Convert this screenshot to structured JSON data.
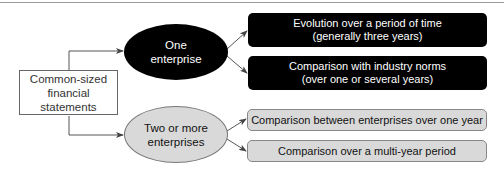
{
  "diagram": {
    "source": {
      "label": "Common-sized\nfinancial\nstatements"
    },
    "branches": [
      {
        "label": "One\nenterprise",
        "style": "black",
        "fill": "#000000",
        "children": [
          {
            "label": "Evolution over a period of time\n(generally three years)"
          },
          {
            "label": "Comparison with industry norms\n(over one or several years)"
          }
        ]
      },
      {
        "label": "Two or more\nenterprises",
        "style": "gray",
        "fill": "#d9d9d9",
        "children": [
          {
            "label": "Comparison between enterprises over one year"
          },
          {
            "label": "Comparison over a multi-year period"
          }
        ]
      }
    ]
  }
}
